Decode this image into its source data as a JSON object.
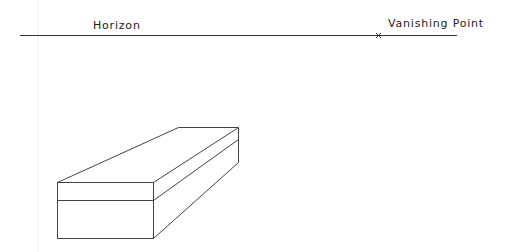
{
  "diagram": {
    "horizon_label": "Horizon",
    "vanishing_point_label": "Vanishing Point",
    "vanishing_point_marker": "x",
    "line_color": "#333333",
    "background": "#ffffff"
  }
}
